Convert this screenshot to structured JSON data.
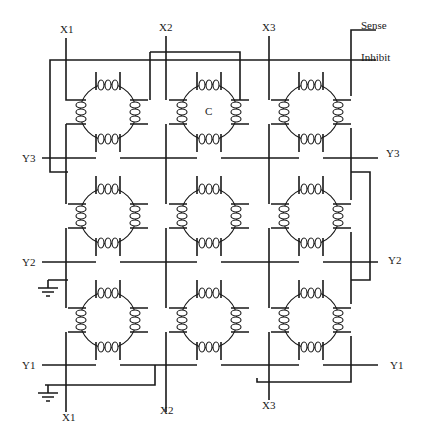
{
  "diagram": {
    "type": "magnetic core memory matrix (3x3)",
    "labels": {
      "x_top": [
        "X1",
        "X2",
        "X3"
      ],
      "x_bottom": [
        "X1",
        "X2",
        "X3"
      ],
      "y_left": [
        "Y3",
        "Y2",
        "Y1"
      ],
      "y_right": [
        "Y3",
        "Y2",
        "Y1"
      ],
      "sense": "Sense",
      "inhibit": "Inhibit",
      "core_marker": "C"
    },
    "grid": {
      "rows": 3,
      "columns": 3
    },
    "grounds": 2,
    "colors": {
      "line": "#1a1a1a",
      "background": "#ffffff"
    }
  }
}
